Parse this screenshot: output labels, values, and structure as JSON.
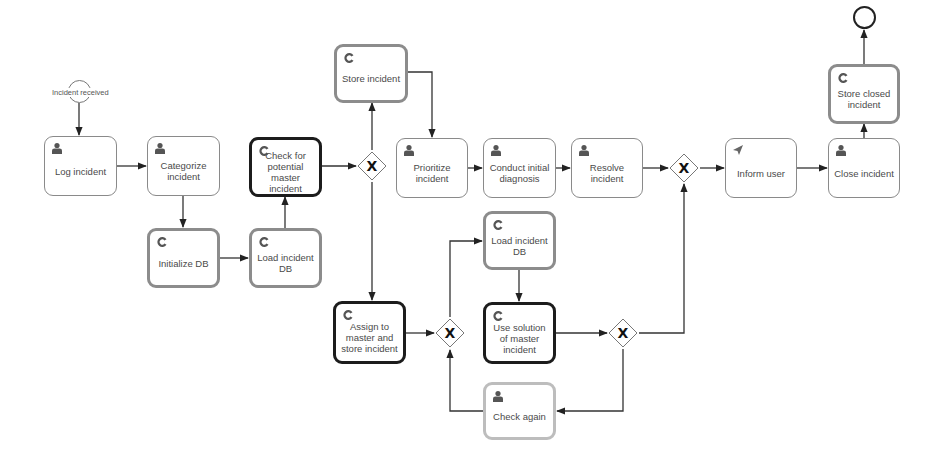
{
  "diagram": {
    "type": "BPMN process",
    "start_event": {
      "label": "Incident received"
    },
    "end_event": {
      "label": ""
    },
    "tasks": [
      {
        "id": "log",
        "label": "Log incident",
        "type": "user"
      },
      {
        "id": "categorize",
        "label": "Categorize incident",
        "type": "user"
      },
      {
        "id": "initdb",
        "label": "Initialize DB",
        "type": "service"
      },
      {
        "id": "loaddb1",
        "label": "Load incident DB",
        "type": "service"
      },
      {
        "id": "check_master",
        "label": "Check for potential master incident",
        "type": "service"
      },
      {
        "id": "store",
        "label": "Store incident",
        "type": "service"
      },
      {
        "id": "prioritize",
        "label": "Prioritize incident",
        "type": "user"
      },
      {
        "id": "diagnosis",
        "label": "Conduct initial diagnosis",
        "type": "user"
      },
      {
        "id": "resolve",
        "label": "Resolve incident",
        "type": "user"
      },
      {
        "id": "inform",
        "label": "Inform user",
        "type": "send"
      },
      {
        "id": "close",
        "label": "Close incident",
        "type": "user"
      },
      {
        "id": "store_closed",
        "label": "Store closed incident",
        "type": "service"
      },
      {
        "id": "assign",
        "label": "Assign to master and store incident",
        "type": "service"
      },
      {
        "id": "loaddb2",
        "label": "Load incident DB",
        "type": "service"
      },
      {
        "id": "use_solution",
        "label": "Use solution of master incident",
        "type": "service"
      },
      {
        "id": "check_again",
        "label": "Check again",
        "type": "user"
      }
    ],
    "gateways": [
      {
        "id": "g1",
        "symbol": "X",
        "type": "exclusive"
      },
      {
        "id": "g2",
        "symbol": "X",
        "type": "exclusive"
      },
      {
        "id": "g3",
        "symbol": "X",
        "type": "exclusive"
      },
      {
        "id": "g4",
        "symbol": "X",
        "type": "exclusive"
      }
    ],
    "flows": [
      [
        "start",
        "log"
      ],
      [
        "log",
        "categorize"
      ],
      [
        "categorize",
        "initdb"
      ],
      [
        "initdb",
        "loaddb1"
      ],
      [
        "loaddb1",
        "check_master"
      ],
      [
        "check_master",
        "g1"
      ],
      [
        "g1",
        "store"
      ],
      [
        "g1",
        "assign"
      ],
      [
        "store",
        "prioritize"
      ],
      [
        "prioritize",
        "diagnosis"
      ],
      [
        "diagnosis",
        "resolve"
      ],
      [
        "resolve",
        "g2"
      ],
      [
        "g2",
        "inform"
      ],
      [
        "inform",
        "close"
      ],
      [
        "close",
        "store_closed"
      ],
      [
        "store_closed",
        "end"
      ],
      [
        "assign",
        "g3"
      ],
      [
        "g3",
        "loaddb2"
      ],
      [
        "loaddb2",
        "use_solution"
      ],
      [
        "use_solution",
        "g4"
      ],
      [
        "g4",
        "g2"
      ],
      [
        "g4",
        "check_again"
      ],
      [
        "check_again",
        "g3"
      ]
    ],
    "colors": {
      "user_icon": "#555555",
      "service_border": "#8c8c8c",
      "highlight_border": "#1c1c1c",
      "check_again_border": "#bdbdbd",
      "edge": "#333333"
    }
  }
}
